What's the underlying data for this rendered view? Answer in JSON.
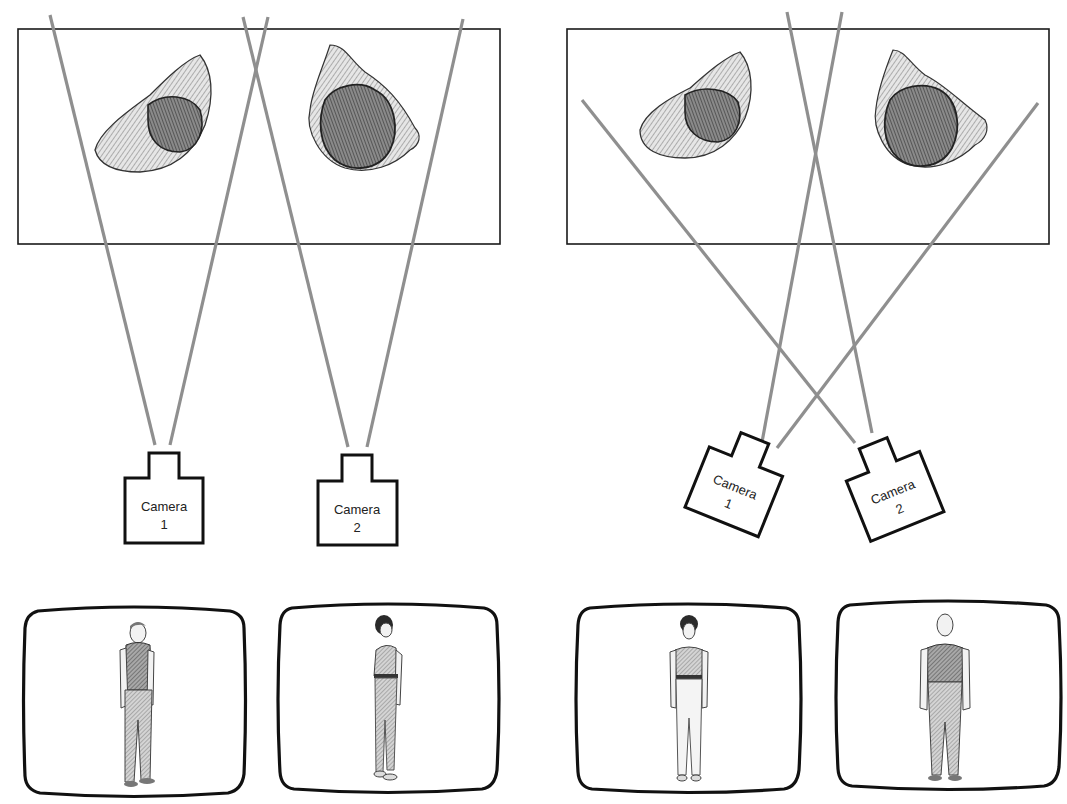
{
  "colors": {
    "beam": "#8f8f8f",
    "outline": "#111111",
    "background": "#ffffff"
  },
  "panels": [
    {
      "name": "parallel-setup",
      "frame": {
        "x": 18,
        "y": 29,
        "w": 482,
        "h": 215
      },
      "objects": [
        {
          "name": "object-left",
          "cx": 160,
          "cy": 110
        },
        {
          "name": "object-right",
          "cx": 365,
          "cy": 110
        }
      ],
      "cameras": [
        {
          "id": 1,
          "label_line1": "Camera",
          "label_line2": "1",
          "x": 125,
          "y": 453,
          "rotation": 0
        },
        {
          "id": 2,
          "label_line1": "Camera",
          "label_line2": "2",
          "x": 318,
          "y": 455,
          "rotation": 0
        }
      ],
      "beams": [
        {
          "x1": 50,
          "y1": 15,
          "x2": 155,
          "y2": 445
        },
        {
          "x1": 268,
          "y1": 17,
          "x2": 170,
          "y2": 445
        },
        {
          "x1": 243,
          "y1": 17,
          "x2": 348,
          "y2": 447
        },
        {
          "x1": 463,
          "y1": 19,
          "x2": 367,
          "y2": 447
        }
      ],
      "monitors": [
        {
          "name": "monitor-camera-1",
          "x": 24,
          "y": 608,
          "w": 220,
          "h": 188,
          "figure": "man-three-quarter"
        },
        {
          "name": "monitor-camera-2",
          "x": 278,
          "y": 604,
          "w": 220,
          "h": 190,
          "figure": "woman-three-quarter"
        }
      ]
    },
    {
      "name": "crossed-setup",
      "frame": {
        "x": 567,
        "y": 29,
        "w": 482,
        "h": 215
      },
      "objects": [
        {
          "name": "object-left",
          "cx": 700,
          "cy": 105
        },
        {
          "name": "object-right",
          "cx": 930,
          "cy": 110
        }
      ],
      "cameras": [
        {
          "id": 1,
          "label_line1": "Camera",
          "label_line2": "1",
          "x": 738,
          "y": 470,
          "rotation": 22
        },
        {
          "id": 2,
          "label_line1": "Camera",
          "label_line2": "2",
          "x": 880,
          "y": 475,
          "rotation": -22
        }
      ],
      "beams": [
        {
          "x1": 842,
          "y1": 12,
          "x2": 762,
          "y2": 442
        },
        {
          "x1": 1038,
          "y1": 103,
          "x2": 777,
          "y2": 448
        },
        {
          "x1": 582,
          "y1": 100,
          "x2": 855,
          "y2": 443
        },
        {
          "x1": 787,
          "y1": 12,
          "x2": 872,
          "y2": 433
        }
      ],
      "monitors": [
        {
          "name": "monitor-camera-1",
          "x": 577,
          "y": 604,
          "w": 222,
          "h": 190,
          "figure": "woman-front"
        },
        {
          "name": "monitor-camera-2",
          "x": 837,
          "y": 601,
          "w": 222,
          "h": 190,
          "figure": "man-front"
        }
      ]
    }
  ]
}
